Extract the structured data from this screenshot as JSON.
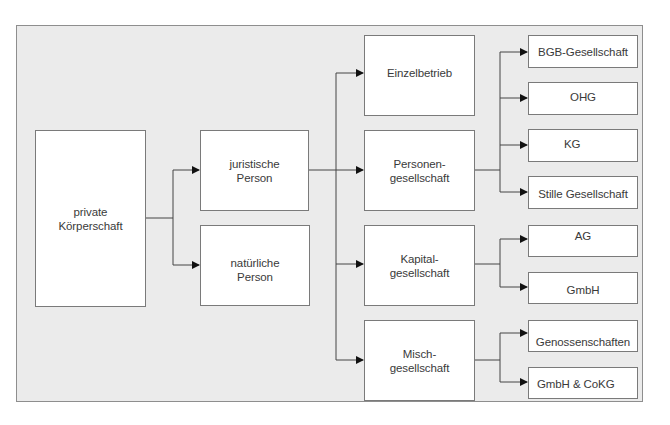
{
  "diagram": {
    "type": "hierarchy",
    "root": {
      "id": "root",
      "label_lines": [
        "private",
        "Körperschaft"
      ],
      "children": [
        {
          "id": "juristische",
          "label_lines": [
            "juristische",
            "Person"
          ],
          "children": [
            {
              "id": "einzel",
              "label_lines": [
                "Einzelbetrieb"
              ],
              "children": []
            },
            {
              "id": "personen",
              "label_lines": [
                "Personen-",
                "gesellschaft"
              ],
              "children": [
                {
                  "id": "bgb",
                  "label_lines": [
                    "BGB-Gesellschaft"
                  ]
                },
                {
                  "id": "ohg",
                  "label_lines": [
                    "OHG"
                  ]
                },
                {
                  "id": "kg",
                  "label_lines": [
                    "KG"
                  ]
                },
                {
                  "id": "stille",
                  "label_lines": [
                    "Stille Gesellschaft"
                  ]
                }
              ]
            },
            {
              "id": "kapital",
              "label_lines": [
                "Kapital-",
                "gesellschaft"
              ],
              "children": [
                {
                  "id": "ag",
                  "label_lines": [
                    "AG"
                  ]
                },
                {
                  "id": "gmbh",
                  "label_lines": [
                    "GmbH"
                  ]
                }
              ]
            },
            {
              "id": "misch",
              "label_lines": [
                "Misch-",
                "gesellschaft"
              ],
              "children": [
                {
                  "id": "geno",
                  "label_lines": [
                    "Genossenschaften"
                  ]
                },
                {
                  "id": "gmbhcokg",
                  "label_lines": [
                    "GmbH & CoKG"
                  ]
                }
              ]
            }
          ]
        },
        {
          "id": "natuerlich",
          "label_lines": [
            "natürliche",
            "Person"
          ],
          "children": []
        }
      ]
    }
  },
  "labels": {
    "root": [
      "private",
      "Körperschaft"
    ],
    "juristische": [
      "juristische",
      "Person"
    ],
    "natuerlich": [
      "natürliche",
      "Person"
    ],
    "einzel": [
      "Einzelbetrieb"
    ],
    "personen": [
      "Personen-",
      "gesellschaft"
    ],
    "kapital": [
      "Kapital-",
      "gesellschaft"
    ],
    "misch": [
      "Misch-",
      "gesellschaft"
    ],
    "bgb": [
      "BGB-Gesellschaft"
    ],
    "ohg": [
      "OHG"
    ],
    "kg": [
      "KG"
    ],
    "stille": [
      "Stille Gesellschaft"
    ],
    "ag": [
      "AG"
    ],
    "gmbh": [
      "GmbH"
    ],
    "geno": [
      "Genossenschaften"
    ],
    "gmbhcokg": [
      "GmbH & CoKG"
    ]
  },
  "colors": {
    "panel_background": "#ebebeb",
    "box_background": "#ffffff",
    "box_border": "#7a7a7a",
    "connector": "#333333",
    "text": "#3a3a3a"
  }
}
